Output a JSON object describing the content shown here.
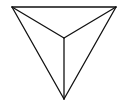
{
  "diagram": {
    "type": "tetrahedron-top-view",
    "stroke_color": "#111111",
    "background": "#ffffff",
    "vertices": {
      "top_left": [
        12,
        7
      ],
      "top_right": [
        116,
        7
      ],
      "bottom": [
        64,
        99
      ],
      "center": [
        64,
        38
      ]
    }
  }
}
